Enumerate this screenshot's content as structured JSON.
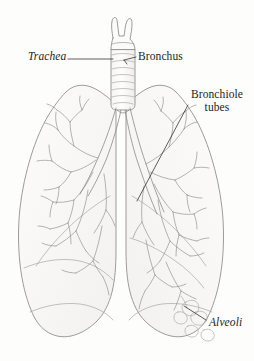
{
  "figure": {
    "background_color": "#fdfdfc",
    "width": 254,
    "height": 361,
    "medium": "pencil-sketch",
    "cut_off_line_above": "of the lungs"
  },
  "labels": {
    "trachea": {
      "text": "Trachea",
      "style": "italic",
      "color": "#211f1e",
      "leader": "horizontal-line-right"
    },
    "bronchus": {
      "text": "Bronchus",
      "style": "upright",
      "color": "#211f1e",
      "leader": "short-tick-left"
    },
    "bronchiole": {
      "line1": "Bronchiole",
      "line2": "tubes",
      "style": "upright",
      "color": "#211f1e",
      "leader": "diagonal-line-down-left"
    },
    "alveoli": {
      "text": "Alveoli",
      "style": "italic",
      "color": "#211f1e",
      "leader": "short-diagonal-line-up-left"
    }
  },
  "drawing": {
    "stroke_color": "#8d8a86",
    "light_stroke_color": "#b9b6b1",
    "fill_color": "#fbfbfa",
    "parts": [
      "larynx",
      "trachea",
      "left-bronchus",
      "right-bronchus",
      "left-lung",
      "right-lung",
      "bronchiole-tree-left",
      "bronchiole-tree-right",
      "alveoli-cluster"
    ]
  }
}
